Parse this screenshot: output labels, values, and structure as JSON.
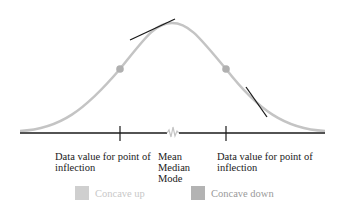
{
  "diagram": {
    "colors": {
      "curve": "#c4c4c4",
      "axis": "#1a1a1a",
      "tangent": "#1a1a1a",
      "inflection_point": "#b0b0b0",
      "concave_up": "#cfcfcf",
      "concave_down": "#b3b3b3",
      "concave_up_text": "#c8c8c8",
      "concave_down_text": "#9a9a9a"
    },
    "labels": {
      "left_inflection_line1": "Data value for point of",
      "left_inflection_line2": "inflection",
      "center_line1": "Mean",
      "center_line2": "Median",
      "center_line3": "Mode",
      "right_inflection_line1": "Data value for point of",
      "right_inflection_line2": "inflection"
    },
    "legend": [
      {
        "label": "Concave up",
        "icon": "light-gray-square"
      },
      {
        "label": "Concave down",
        "icon": "dark-gray-square"
      }
    ]
  }
}
